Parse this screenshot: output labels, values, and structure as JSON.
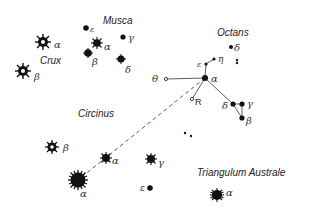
{
  "constellations": {
    "crux": "Crux",
    "musca": "Musca",
    "octans": "Octans",
    "circinus": "Circinus",
    "triangulum_australe": "Triangulum Australe"
  },
  "stars": {
    "crux_alpha": "α",
    "crux_beta": "β",
    "musca_epsilon": "ε",
    "musca_gamma": "γ",
    "musca_alpha": "α",
    "musca_beta": "β",
    "musca_delta": "δ",
    "octans_delta": "δ",
    "octans_epsilon": "ε",
    "octans_eta": "η",
    "octans_theta": "θ",
    "octans_alpha": "α",
    "octans_r": "R",
    "octans_delta2": "δ",
    "octans_gamma": "γ",
    "octans_beta": "β",
    "circinus_beta": "β",
    "circinus_alpha": "α",
    "circinus_gamma": "γ",
    "circinus_epsilon": "ε",
    "centaurus_alpha": "α",
    "tra_alpha": "α"
  },
  "colors": {
    "ink": "#111111",
    "line": "#333333"
  }
}
